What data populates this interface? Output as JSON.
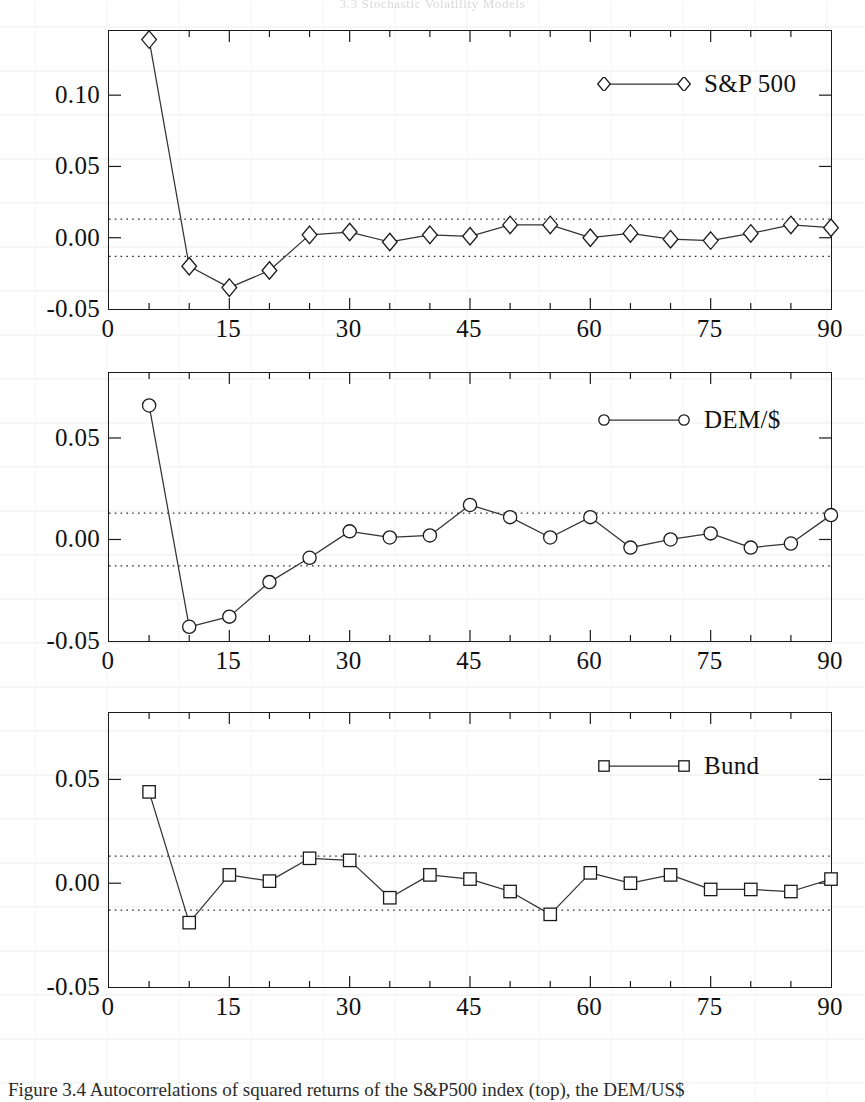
{
  "running_head": "3.3  Stochastic Volatility Models",
  "caption": "Figure 3.4  Autocorrelations of squared returns of the S&P500 index (top), the DEM/US$",
  "colors": {
    "ink": "#1a1a1a",
    "line": "#333333",
    "band": "#2b2b2b"
  },
  "axis": {
    "x_label_values": [
      "0",
      "15",
      "30",
      "45",
      "60",
      "75",
      "90"
    ],
    "x_ticks": [
      0,
      15,
      30,
      45,
      60,
      75,
      90
    ],
    "x_minor_step": 5,
    "x_min": 0,
    "x_max": 90
  },
  "confidence_band": {
    "upper": 0.013,
    "lower": -0.013,
    "style": "dotted"
  },
  "panels": [
    {
      "id": "sp500",
      "legend_label": "S&P 500",
      "marker": "diamond-marker",
      "y_label_values": [
        "0.10",
        "0.05",
        "0.00",
        "-0.05"
      ],
      "y_ticks": [
        0.1,
        0.05,
        0.0,
        -0.05
      ],
      "y_min": -0.05,
      "y_max": 0.145
    },
    {
      "id": "dem_usd",
      "legend_label": "DEM/$",
      "marker": "circle-marker",
      "y_label_values": [
        "0.05",
        "0.00",
        "-0.05"
      ],
      "y_ticks": [
        0.05,
        0.0,
        -0.05
      ],
      "y_min": -0.05,
      "y_max": 0.082
    },
    {
      "id": "bund",
      "legend_label": "Bund",
      "marker": "square-marker",
      "y_label_values": [
        "0.05",
        "0.00",
        "-0.05"
      ],
      "y_ticks": [
        0.05,
        0.0,
        -0.05
      ],
      "y_min": -0.05,
      "y_max": 0.082
    }
  ],
  "chart_data": [
    {
      "type": "line",
      "title": "S&P 500",
      "xlabel": "",
      "ylabel": "",
      "xlim": [
        0,
        90
      ],
      "ylim": [
        -0.05,
        0.145
      ],
      "grid": false,
      "legend_position": "top-right",
      "marker": "diamond",
      "annotations": [
        "confidence band at +0.013",
        "confidence band at -0.013"
      ],
      "x": [
        5,
        10,
        15,
        20,
        25,
        30,
        35,
        40,
        45,
        50,
        55,
        60,
        65,
        70,
        75,
        80,
        85,
        90
      ],
      "values": [
        0.139,
        -0.02,
        -0.035,
        -0.023,
        0.002,
        0.004,
        -0.003,
        0.002,
        0.001,
        0.009,
        0.009,
        0.0,
        0.003,
        -0.001,
        -0.002,
        0.003,
        0.009,
        0.007
      ]
    },
    {
      "type": "line",
      "title": "DEM/$",
      "xlabel": "",
      "ylabel": "",
      "xlim": [
        0,
        90
      ],
      "ylim": [
        -0.05,
        0.082
      ],
      "grid": false,
      "legend_position": "top-right",
      "marker": "circle",
      "annotations": [
        "confidence band at +0.013",
        "confidence band at -0.013"
      ],
      "x": [
        5,
        10,
        15,
        20,
        25,
        30,
        35,
        40,
        45,
        50,
        55,
        60,
        65,
        70,
        75,
        80,
        85,
        90
      ],
      "values": [
        0.066,
        -0.043,
        -0.038,
        -0.021,
        -0.009,
        0.004,
        0.001,
        0.002,
        0.017,
        0.011,
        0.001,
        0.011,
        -0.004,
        0.0,
        0.003,
        -0.004,
        -0.002,
        0.012
      ]
    },
    {
      "type": "line",
      "title": "Bund",
      "xlabel": "",
      "ylabel": "",
      "xlim": [
        0,
        90
      ],
      "ylim": [
        -0.05,
        0.082
      ],
      "grid": false,
      "legend_position": "top-right",
      "marker": "square",
      "annotations": [
        "confidence band at +0.013",
        "confidence band at -0.013"
      ],
      "x": [
        5,
        10,
        15,
        20,
        25,
        30,
        35,
        40,
        45,
        50,
        55,
        60,
        65,
        70,
        75,
        80,
        85,
        90
      ],
      "values": [
        0.044,
        -0.019,
        0.004,
        0.001,
        0.012,
        0.011,
        -0.007,
        0.004,
        0.002,
        -0.004,
        -0.015,
        0.005,
        0.0,
        0.004,
        -0.003,
        -0.003,
        -0.004,
        0.002
      ]
    }
  ]
}
